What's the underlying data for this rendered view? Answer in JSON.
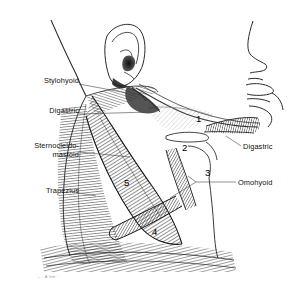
{
  "figure": {
    "background_color": "#ffffff",
    "ink_color": "#1a1a1a",
    "leader_color": "#555555"
  },
  "labels_left": [
    {
      "name": "stylohyoid",
      "text": "Stylohyoid",
      "x": 14,
      "y": 80
    },
    {
      "name": "digastric",
      "text": "Digastric",
      "x": 33,
      "y": 110
    },
    {
      "name": "sternocleidomastoid",
      "text": "Sternocleido-",
      "text2": "mastoid",
      "x": 14,
      "y": 144
    },
    {
      "name": "trapezius",
      "text": "Trapezius",
      "x": 30,
      "y": 189
    }
  ],
  "labels_right": [
    {
      "name": "digastric-right",
      "text": "Digastric",
      "x": 243,
      "y": 142
    },
    {
      "name": "omohyoid",
      "text": "Omohyoid",
      "x": 238,
      "y": 178
    }
  ],
  "numbers": [
    {
      "name": "submandibular-triangle",
      "value": "1",
      "x": 196,
      "y": 118
    },
    {
      "name": "carotid-triangle",
      "value": "2",
      "x": 182,
      "y": 147
    },
    {
      "name": "muscular-triangle",
      "value": "3",
      "x": 205,
      "y": 172
    },
    {
      "name": "subclavian-triangle",
      "value": "4",
      "x": 152,
      "y": 231
    },
    {
      "name": "posterior-triangle",
      "value": "5",
      "x": 124,
      "y": 182
    }
  ],
  "signature": {
    "text": "– · A·hm··",
    "x": 38,
    "y": 276
  }
}
